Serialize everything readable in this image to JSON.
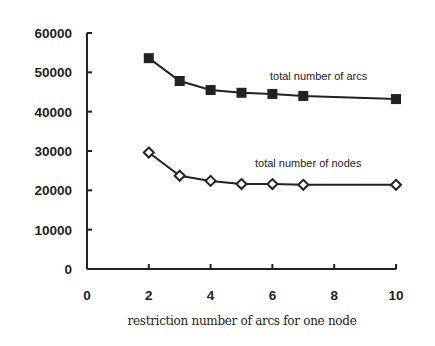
{
  "chart_data": {
    "type": "line",
    "title": "",
    "xlabel": "restriction number of arcs for one node",
    "ylabel": "",
    "xlim": [
      0,
      10
    ],
    "ylim": [
      0,
      60000
    ],
    "x_ticks": [
      0,
      2,
      4,
      6,
      8,
      10
    ],
    "y_ticks": [
      0,
      10000,
      20000,
      30000,
      40000,
      50000,
      60000
    ],
    "x_tick_labels": [
      "0",
      "2",
      "4",
      "6",
      "8",
      "10"
    ],
    "y_tick_labels": [
      "0",
      "10000",
      "20000",
      "30000",
      "40000",
      "50000",
      "60000"
    ],
    "grid": false,
    "legend": "none",
    "series": [
      {
        "name": "total number of arcs",
        "marker": "filled-square",
        "x": [
          2,
          3,
          4,
          5,
          6,
          7,
          10
        ],
        "values": [
          53600,
          47800,
          45500,
          44800,
          44500,
          44000,
          43200
        ]
      },
      {
        "name": "total number of nodes",
        "marker": "hollow-diamond",
        "x": [
          2,
          3,
          4,
          5,
          6,
          7,
          10
        ],
        "values": [
          29600,
          23700,
          22400,
          21600,
          21600,
          21400,
          21400
        ]
      }
    ],
    "annotations": [
      {
        "text": "total number of arcs",
        "series": 0
      },
      {
        "text": "total number of nodes",
        "series": 1
      }
    ]
  }
}
